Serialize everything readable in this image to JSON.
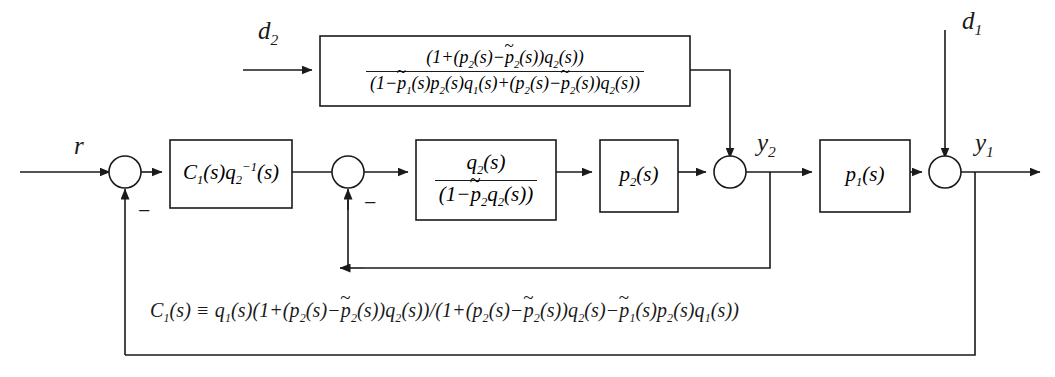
{
  "diagram": {
    "background_color": "#ffffff",
    "line_color": "#1a1a1a",
    "signals": {
      "reference": "r",
      "disturbance_1": "d",
      "disturbance_1_sub": "1",
      "disturbance_2": "d",
      "disturbance_2_sub": "2",
      "output_1": "y",
      "output_1_sub": "1",
      "output_2": "y",
      "output_2_sub": "2",
      "minus": "−"
    },
    "blocks": {
      "disturbance_filter": {
        "name": "disturbance-feedforward-block",
        "numerator": {
          "p1": "(1+(",
          "p2": "p",
          "p2_sub": "2",
          "p3": "(s)−",
          "p4": "p",
          "p4_sub": "2",
          "p5": "(s))",
          "p6": "q",
          "p6_sub": "2",
          "p7": "(s))"
        },
        "denominator": {
          "d1": "(1−",
          "d2": "p",
          "d2_sub": "1",
          "d3": "(s)",
          "d4": "p",
          "d4_sub": "2",
          "d5": "(s)",
          "d6": "q",
          "d6_sub": "1",
          "d7": "(s)+(",
          "d8": "p",
          "d8_sub": "2",
          "d9": "(s)−",
          "d10": "p",
          "d10_sub": "2",
          "d11": "(s))",
          "d12": "q",
          "d12_sub": "2",
          "d13": "(s))"
        }
      },
      "controller": {
        "name": "controller-block",
        "c": "C",
        "c_sub": "1",
        "c_args": "(s)",
        "q": "q",
        "q_sub": "2",
        "q_sup": "−1",
        "q_args": "(s)"
      },
      "inner_filter": {
        "name": "inner-filter-block",
        "num_q": "q",
        "num_sub": "2",
        "num_args": "(s)",
        "den_open": "(1−",
        "den_p": "p",
        "den_p_sub": "2",
        "den_q": "q",
        "den_q_sub": "2",
        "den_close": "(s))"
      },
      "plant_2": {
        "name": "plant-p2-block",
        "p": "p",
        "p_sub": "2",
        "args": "(s)"
      },
      "plant_1": {
        "name": "plant-p1-block",
        "p": "p",
        "p_sub": "1",
        "args": "(s)"
      }
    },
    "definition_equation": {
      "name": "controller-definition-equation",
      "parts": {
        "t1": "C",
        "t1_sub": "1",
        "t2": "(s) ≡ ",
        "t3": "q",
        "t3_sub": "1",
        "t4": "(s)(1+(",
        "t5": "p",
        "t5_sub": "2",
        "t6": "(s)−",
        "t7": "p",
        "t7_sub": "2",
        "t8": "(s))",
        "t9": "q",
        "t9_sub": "2",
        "t10": "(s))/(1+(",
        "t11": "p",
        "t11_sub": "2",
        "t12": "(s)−",
        "t13": "p",
        "t13_sub": "2",
        "t14": "(s))",
        "t15": "q",
        "t15_sub": "2",
        "t16": "(s)−",
        "t17": "p",
        "t17_sub": "1",
        "t18": "(s)",
        "t19": "p",
        "t19_sub": "2",
        "t20": "(s)",
        "t21": "q",
        "t21_sub": "1",
        "t22": "(s))"
      }
    },
    "junctions": {
      "sum_outer": "summing-junction-outer",
      "sum_inner": "summing-junction-inner",
      "sum_y2": "summing-junction-y2",
      "sum_y1": "summing-junction-y1"
    }
  }
}
